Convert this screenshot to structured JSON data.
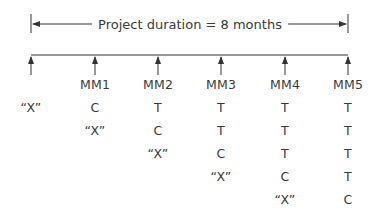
{
  "title": "Project duration = 8 months",
  "colors": {
    "line": "#333333",
    "text": "#3a3a3a"
  },
  "timeline": {
    "ticks_x": [
      31,
      95,
      158,
      221,
      285,
      348
    ]
  },
  "columns": {
    "headers": [
      "",
      "MM1",
      "MM2",
      "MM3",
      "MM4",
      "MM5"
    ]
  },
  "rows": [
    [
      "“X”",
      "C",
      "T",
      "T",
      "T",
      "T"
    ],
    [
      "",
      "“X”",
      "C",
      "T",
      "T",
      "T"
    ],
    [
      "",
      "",
      "“X”",
      "C",
      "T",
      "T"
    ],
    [
      "",
      "",
      "",
      "“X”",
      "C",
      "T"
    ],
    [
      "",
      "",
      "",
      "",
      "“X”",
      "C"
    ]
  ]
}
